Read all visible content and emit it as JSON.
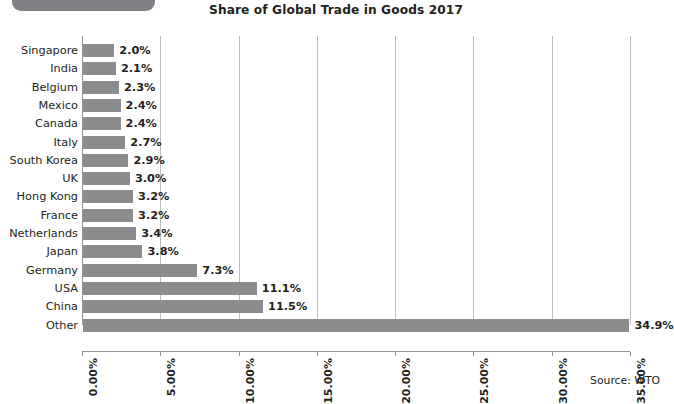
{
  "decor": {
    "tab_color": "#808184"
  },
  "source_note": "Source: WTO",
  "chart_data": {
    "type": "bar",
    "orientation": "horizontal",
    "title": "Share of Global Trade in Goods 2017",
    "xlabel": "",
    "ylabel": "",
    "xlim": [
      0,
      35
    ],
    "grid": true,
    "legend": false,
    "bar_color": "#8c8c8e",
    "gridline_color": "#bcbec0",
    "axis_color": "#939598",
    "tick_labels": [
      "0.00%",
      "5.00%",
      "10.00%",
      "15.00%",
      "20.00%",
      "25.00%",
      "30.00%",
      "35.00%"
    ],
    "tick_values": [
      0,
      5,
      10,
      15,
      20,
      25,
      30,
      35
    ],
    "categories": [
      "Singapore",
      "India",
      "Belgium",
      "Mexico",
      "Canada",
      "Italy",
      "South Korea",
      "UK",
      "Hong Kong",
      "France",
      "Netherlands",
      "Japan",
      "Germany",
      "USA",
      "China",
      "Other"
    ],
    "values": [
      2.0,
      2.1,
      2.3,
      2.4,
      2.4,
      2.7,
      2.9,
      3.0,
      3.2,
      3.2,
      3.4,
      3.8,
      7.3,
      11.1,
      11.5,
      34.9
    ],
    "data_labels": [
      "2.0%",
      "2.1%",
      "2.3%",
      "2.4%",
      "2.4%",
      "2.7%",
      "2.9%",
      "3.0%",
      "3.2%",
      "3.2%",
      "3.4%",
      "3.8%",
      "7.3%",
      "11.1%",
      "11.5%",
      "34.9%"
    ]
  }
}
